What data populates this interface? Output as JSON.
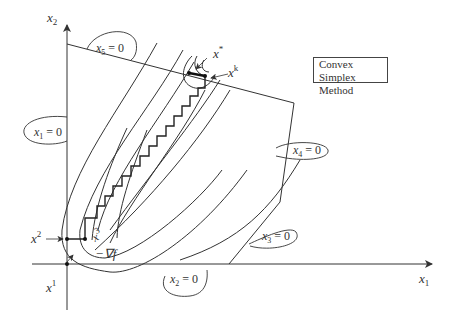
{
  "title": {
    "line1": "Convex Simplex",
    "line2": "Method"
  },
  "axes": {
    "x_label": "x",
    "x_sub": "1",
    "y_label": "x",
    "y_sub": "2"
  },
  "constraints": [
    {
      "var": "x",
      "sub": "1",
      "text": "= 0"
    },
    {
      "var": "x",
      "sub": "2",
      "text": "= 0"
    },
    {
      "var": "x",
      "sub": "3",
      "text": "= 0"
    },
    {
      "var": "x",
      "sub": "4",
      "text": "= 0"
    },
    {
      "var": "x",
      "sub": "5",
      "text": "= 0"
    }
  ],
  "points": [
    {
      "name": "x",
      "sup": "1"
    },
    {
      "name": "x",
      "sup": "2"
    },
    {
      "name": "x",
      "sup": "3"
    },
    {
      "name": "x",
      "sup": "k"
    },
    {
      "name": "x",
      "sup": "*"
    }
  ],
  "gradient_label": "−∇f",
  "colors": {
    "stroke": "#333333",
    "background": "#ffffff"
  }
}
